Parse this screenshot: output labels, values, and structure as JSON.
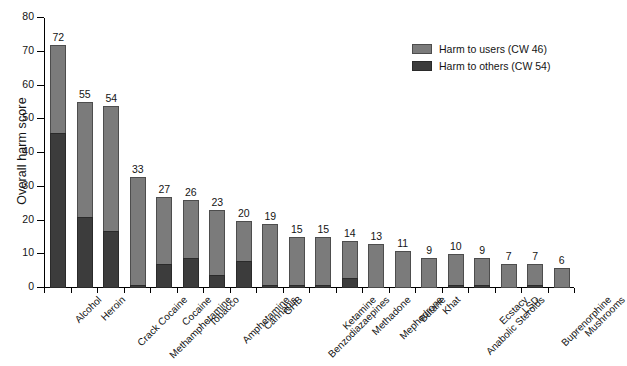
{
  "chart_data": {
    "type": "bar",
    "stacked": true,
    "title": "",
    "xlabel": "",
    "ylabel": "Overall harm score",
    "ylim": [
      0,
      80
    ],
    "yticks": [
      0,
      10,
      20,
      30,
      40,
      50,
      60,
      70,
      80
    ],
    "grid": false,
    "legend_position": "top-right",
    "categories": [
      "Alcohol",
      "Heroin",
      "Crack Cocaine",
      "Methamphetamine",
      "Cocaine",
      "Tobacco",
      "Amphetamine",
      "Cannabis",
      "GHB",
      "Benzodiazaepines",
      "Ketamine",
      "Methadone",
      "Mephedrone",
      "Butane",
      "Khat",
      "Anabolic Steroids",
      "Ecstacy",
      "LSD",
      "Buprenorphine",
      "Mushrooms"
    ],
    "totals": [
      72,
      55,
      54,
      33,
      27,
      26,
      23,
      20,
      19,
      15,
      15,
      14,
      13,
      11,
      9,
      10,
      9,
      7,
      7,
      6
    ],
    "series": [
      {
        "name": "Harm to users (CW 46)",
        "color": "#7b7b7b",
        "values": [
          26,
          34,
          37,
          32,
          20,
          17,
          19,
          12,
          18,
          14,
          14,
          11,
          13,
          11,
          9,
          9,
          8,
          7,
          6,
          6
        ]
      },
      {
        "name": "Harm to others (CW 54)",
        "color": "#3c3c3c",
        "values": [
          46,
          21,
          17,
          1,
          7,
          9,
          4,
          8,
          1,
          1,
          1,
          3,
          0,
          0,
          0,
          1,
          1,
          0,
          1,
          0
        ]
      }
    ]
  },
  "legend": {
    "items": [
      {
        "label": "Harm to users (CW 46)"
      },
      {
        "label": "Harm to others (CW 54)"
      }
    ]
  },
  "axes": {
    "y_title": "Overall harm score"
  }
}
